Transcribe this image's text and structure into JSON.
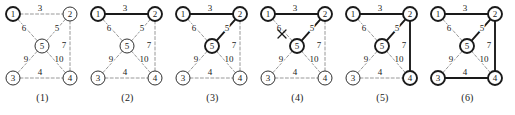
{
  "figure": {
    "width": 515,
    "height": 115,
    "background": "#ffffff"
  },
  "style": {
    "candidate_edge_color": "#8c8c8c",
    "tree_edge_color": "#1a1a1a",
    "node_stroke_color": "#1a1a1a",
    "node_fill": "#ffffff",
    "reject_mark_color": "#1a1a1a",
    "node_radius": 7,
    "thin_stroke_width": 0.9,
    "bold_stroke_width": 1.9,
    "dash_pattern": "3,2.2"
  },
  "nodes": [
    {
      "id": "1",
      "label": "1",
      "cx": 13,
      "cy": 14
    },
    {
      "id": "2",
      "label": "2",
      "cx": 70,
      "cy": 14
    },
    {
      "id": "5",
      "label": "5",
      "cx": 42,
      "cy": 46
    },
    {
      "id": "3",
      "label": "3",
      "cx": 13,
      "cy": 78
    },
    {
      "id": "4",
      "label": "4",
      "cx": 70,
      "cy": 78
    }
  ],
  "edges": [
    {
      "id": "e12",
      "from": "1",
      "to": "2",
      "weight": "3",
      "lx": 40,
      "ly": 8
    },
    {
      "id": "e15",
      "from": "1",
      "to": "5",
      "weight": "6",
      "lx": 24,
      "ly": 28
    },
    {
      "id": "e25",
      "from": "2",
      "to": "5",
      "weight": "5",
      "lx": 57,
      "ly": 28
    },
    {
      "id": "e24",
      "from": "2",
      "to": "4",
      "weight": "7",
      "lx": 64,
      "ly": 45
    },
    {
      "id": "e35",
      "from": "3",
      "to": "5",
      "weight": "9",
      "lx": 26,
      "ly": 59
    },
    {
      "id": "e45",
      "from": "4",
      "to": "5",
      "weight": "10",
      "lx": 59,
      "ly": 59
    },
    {
      "id": "e34",
      "from": "3",
      "to": "4",
      "weight": "4",
      "lx": 40,
      "ly": 72
    }
  ],
  "panels": [
    {
      "caption": "(1)",
      "x": 0,
      "bold_nodes": [
        "1"
      ],
      "tree_edges": [],
      "rejected_edges": [],
      "reject_marks": []
    },
    {
      "caption": "(2)",
      "x": 85,
      "bold_nodes": [
        "1",
        "2"
      ],
      "tree_edges": [
        "e12"
      ],
      "rejected_edges": [],
      "reject_marks": []
    },
    {
      "caption": "(3)",
      "x": 170,
      "bold_nodes": [
        "1",
        "2",
        "5"
      ],
      "tree_edges": [
        "e12",
        "e25"
      ],
      "rejected_edges": [],
      "reject_marks": []
    },
    {
      "caption": "(4)",
      "x": 255,
      "bold_nodes": [
        "1",
        "2",
        "5"
      ],
      "tree_edges": [
        "e12",
        "e25"
      ],
      "rejected_edges": [
        "e15"
      ],
      "reject_marks": [
        {
          "x": 27,
          "y": 34,
          "size": 4
        }
      ]
    },
    {
      "caption": "(5)",
      "x": 340,
      "bold_nodes": [
        "1",
        "2",
        "5",
        "4"
      ],
      "tree_edges": [
        "e12",
        "e25",
        "e24"
      ],
      "rejected_edges": [
        "e15"
      ],
      "reject_marks": []
    },
    {
      "caption": "(6)",
      "x": 425,
      "bold_nodes": [
        "1",
        "2",
        "5",
        "4",
        "3"
      ],
      "tree_edges": [
        "e12",
        "e25",
        "e24",
        "e34"
      ],
      "rejected_edges": [
        "e15"
      ],
      "reject_marks": []
    }
  ]
}
